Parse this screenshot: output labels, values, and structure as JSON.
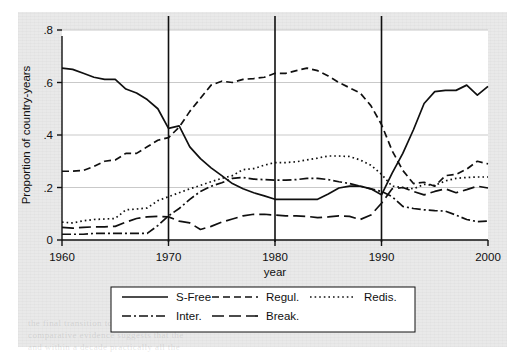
{
  "figure": {
    "background_color": "#e9e9e9",
    "plot_background_color": "#ffffff",
    "line_color": "#101010",
    "grid_color": "#c9c9c9"
  },
  "ghost_text": [
    {
      "text": "the final transition to the new regime was",
      "x": 28,
      "y": 318
    },
    {
      "text": "comparative evidence suggests that the",
      "x": 28,
      "y": 330
    },
    {
      "text": "and within a decade practically all the",
      "x": 28,
      "y": 342
    },
    {
      "text": "a broad measure of regulatory reform across countries",
      "x": 62,
      "y": 46
    }
  ],
  "chart_data": {
    "type": "line",
    "title": "",
    "xlabel": "year",
    "ylabel": "Proportion of country-years",
    "xlim": [
      1960,
      2000
    ],
    "ylim": [
      0,
      0.8
    ],
    "xticks": [
      1960,
      1970,
      1980,
      1990,
      2000
    ],
    "xticklabels": [
      "1960",
      "1970",
      "1980",
      "1990",
      "2000"
    ],
    "yticks": [
      0,
      0.2,
      0.4,
      0.6,
      0.8
    ],
    "yticklabels": [
      "0",
      ".2",
      ".4",
      ".6",
      ".8"
    ],
    "grid": "horizontal",
    "legend_position": "below-outside",
    "vertical_reference_lines": [
      1970,
      1980,
      1990
    ],
    "x": [
      1960,
      1961,
      1962,
      1963,
      1964,
      1965,
      1966,
      1967,
      1968,
      1969,
      1970,
      1971,
      1972,
      1973,
      1974,
      1975,
      1976,
      1977,
      1978,
      1979,
      1980,
      1981,
      1982,
      1983,
      1984,
      1985,
      1986,
      1987,
      1988,
      1989,
      1990,
      1991,
      1992,
      1993,
      1994,
      1995,
      1996,
      1997,
      1998,
      1999,
      2000
    ],
    "series": [
      {
        "name": "S-Free",
        "dash": "solid",
        "values": [
          0.655,
          0.65,
          0.635,
          0.62,
          0.612,
          0.612,
          0.575,
          0.56,
          0.535,
          0.5,
          0.425,
          0.435,
          0.355,
          0.31,
          0.275,
          0.245,
          0.215,
          0.195,
          0.18,
          0.168,
          0.155,
          0.155,
          0.155,
          0.155,
          0.155,
          0.175,
          0.198,
          0.205,
          0.205,
          0.195,
          0.172,
          0.255,
          0.33,
          0.42,
          0.52,
          0.565,
          0.57,
          0.57,
          0.59,
          0.552,
          0.585
        ]
      },
      {
        "name": "Regul.",
        "dash": "dashed",
        "values": [
          0.262,
          0.262,
          0.265,
          0.28,
          0.3,
          0.305,
          0.33,
          0.33,
          0.355,
          0.38,
          0.39,
          0.43,
          0.49,
          0.54,
          0.59,
          0.605,
          0.6,
          0.612,
          0.615,
          0.62,
          0.635,
          0.635,
          0.645,
          0.655,
          0.645,
          0.625,
          0.6,
          0.58,
          0.56,
          0.512,
          0.44,
          0.34,
          0.265,
          0.215,
          0.22,
          0.205,
          0.245,
          0.25,
          0.27,
          0.3,
          0.29
        ]
      },
      {
        "name": "Redis.",
        "dash": "dotted",
        "values": [
          0.068,
          0.065,
          0.073,
          0.078,
          0.08,
          0.082,
          0.115,
          0.118,
          0.122,
          0.15,
          0.165,
          0.18,
          0.195,
          0.208,
          0.222,
          0.235,
          0.245,
          0.268,
          0.272,
          0.285,
          0.295,
          0.295,
          0.298,
          0.305,
          0.312,
          0.32,
          0.32,
          0.318,
          0.305,
          0.285,
          0.25,
          0.205,
          0.2,
          0.195,
          0.212,
          0.208,
          0.225,
          0.235,
          0.238,
          0.24,
          0.24
        ]
      },
      {
        "name": "Inter.",
        "dash": "dashdot",
        "values": [
          0.022,
          0.022,
          0.022,
          0.025,
          0.025,
          0.025,
          0.025,
          0.025,
          0.025,
          0.055,
          0.092,
          0.12,
          0.155,
          0.185,
          0.205,
          0.218,
          0.235,
          0.238,
          0.232,
          0.23,
          0.228,
          0.228,
          0.23,
          0.235,
          0.235,
          0.23,
          0.222,
          0.215,
          0.205,
          0.195,
          0.185,
          0.165,
          0.128,
          0.12,
          0.115,
          0.112,
          0.11,
          0.095,
          0.078,
          0.07,
          0.072
        ]
      },
      {
        "name": "Break.",
        "dash": "longdash",
        "values": [
          0.048,
          0.045,
          0.048,
          0.05,
          0.05,
          0.052,
          0.068,
          0.082,
          0.088,
          0.09,
          0.088,
          0.072,
          0.065,
          0.04,
          0.052,
          0.068,
          0.08,
          0.092,
          0.098,
          0.098,
          0.095,
          0.092,
          0.092,
          0.09,
          0.085,
          0.088,
          0.092,
          0.09,
          0.078,
          0.095,
          0.14,
          0.195,
          0.2,
          0.185,
          0.172,
          0.185,
          0.195,
          0.18,
          0.192,
          0.205,
          0.198
        ]
      }
    ]
  },
  "legend": {
    "entries": [
      {
        "label": "S-Free",
        "dash": "solid"
      },
      {
        "label": "Regul.",
        "dash": "dashed"
      },
      {
        "label": "Redis.",
        "dash": "dotted"
      },
      {
        "label": "Inter.",
        "dash": "dashdot"
      },
      {
        "label": "Break.",
        "dash": "longdash"
      }
    ]
  }
}
